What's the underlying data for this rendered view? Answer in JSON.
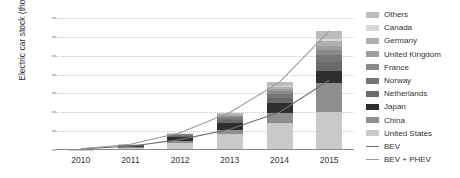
{
  "chart_data": {
    "type": "bar",
    "title": "",
    "xlabel": "",
    "ylabel": "Electric car stock (thousands)",
    "categories": [
      "2010",
      "2011",
      "2012",
      "2013",
      "2014",
      "2015"
    ],
    "ylim": [
      0,
      1400
    ],
    "yticks": [
      0,
      200,
      400,
      600,
      800,
      1000,
      1200,
      1400
    ],
    "grid": true,
    "legend_position": "right",
    "stacked": true,
    "series": [
      {
        "name": "United States",
        "color": "#c9c9c9",
        "values": [
          2,
          22,
          75,
          172,
          290,
          404
        ]
      },
      {
        "name": "China",
        "color": "#8e8e8e",
        "values": [
          1,
          8,
          22,
          45,
          105,
          312
        ]
      },
      {
        "name": "Japan",
        "color": "#2e2e2e",
        "values": [
          2,
          16,
          42,
          74,
          109,
          126
        ]
      },
      {
        "name": "Netherlands",
        "color": "#6a6a6a",
        "values": [
          0,
          2,
          7,
          29,
          45,
          88
        ]
      },
      {
        "name": "Norway",
        "color": "#767676",
        "values": [
          0,
          4,
          10,
          20,
          44,
          74
        ]
      },
      {
        "name": "France",
        "color": "#8a8a8a",
        "values": [
          0,
          3,
          9,
          19,
          32,
          54
        ]
      },
      {
        "name": "United Kingdom",
        "color": "#9e9e9e",
        "values": [
          0,
          1,
          3,
          7,
          24,
          49
        ]
      },
      {
        "name": "Germany",
        "color": "#b0b0b0",
        "values": [
          0,
          2,
          5,
          12,
          24,
          49
        ]
      },
      {
        "name": "Canada",
        "color": "#d8d8d8",
        "values": [
          0,
          1,
          3,
          6,
          11,
          18
        ]
      },
      {
        "name": "Others",
        "color": "#bdbdbd",
        "values": [
          0,
          2,
          6,
          14,
          36,
          86
        ]
      }
    ],
    "lines": [
      {
        "name": "BEV",
        "color": "#6f6f6f",
        "values": [
          12,
          40,
          110,
          220,
          400,
          740
        ]
      },
      {
        "name": "BEV + PHEV",
        "color": "#9a9a9a",
        "values": [
          14,
          61,
          182,
          398,
          720,
          1260
        ]
      }
    ],
    "legend_entries": [
      {
        "label": "Others",
        "kind": "swatch",
        "color": "#bdbdbd"
      },
      {
        "label": "Canada",
        "kind": "swatch",
        "color": "#d8d8d8"
      },
      {
        "label": "Germany",
        "kind": "swatch",
        "color": "#b0b0b0"
      },
      {
        "label": "United Kingdom",
        "kind": "swatch",
        "color": "#9e9e9e"
      },
      {
        "label": "France",
        "kind": "swatch",
        "color": "#8a8a8a"
      },
      {
        "label": "Norway",
        "kind": "swatch",
        "color": "#767676"
      },
      {
        "label": "Netherlands",
        "kind": "swatch",
        "color": "#6a6a6a"
      },
      {
        "label": "Japan",
        "kind": "swatch",
        "color": "#2e2e2e"
      },
      {
        "label": "China",
        "kind": "swatch",
        "color": "#8e8e8e"
      },
      {
        "label": "United States",
        "kind": "swatch",
        "color": "#c9c9c9"
      },
      {
        "label": "BEV",
        "kind": "line",
        "color": "#6f6f6f"
      },
      {
        "label": "BEV + PHEV",
        "kind": "line",
        "color": "#9a9a9a"
      }
    ]
  }
}
